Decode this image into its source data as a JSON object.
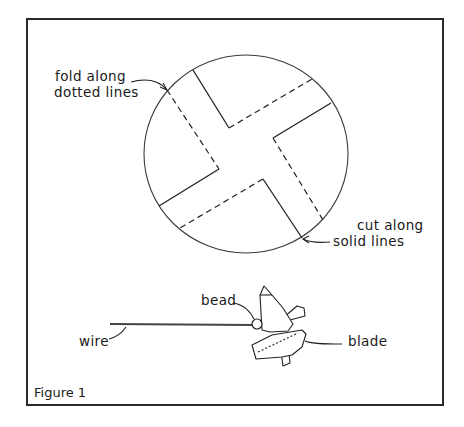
{
  "figure": {
    "caption": "Figure 1",
    "labels": {
      "fold_line1": "fold along",
      "fold_line2": "dotted lines",
      "cut_line1": "cut along",
      "cut_line2": "solid lines",
      "bead": "bead",
      "wire": "wire",
      "blade": "blade"
    },
    "colors": {
      "ink": "#222222",
      "background": "#ffffff"
    }
  }
}
